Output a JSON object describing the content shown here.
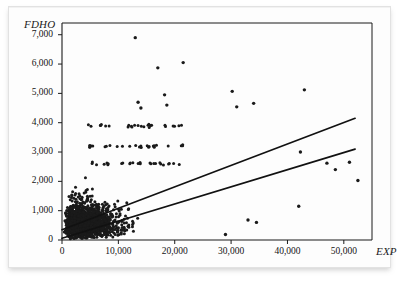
{
  "figure": {
    "kind": "scatter-plot-with-regression-lines",
    "background_color": "#ffffff",
    "border_color": "#e2e2e2",
    "ink_color": "#1a1a1a"
  },
  "chart_data": {
    "type": "scatter",
    "title": "",
    "subtitle": "",
    "xlabel": "EXP",
    "ylabel": "FDHO",
    "xlim": [
      0,
      55000
    ],
    "ylim": [
      0,
      7400
    ],
    "grid": false,
    "legend": null,
    "xticks": [
      0,
      10000,
      20000,
      30000,
      40000,
      50000
    ],
    "xticklabels": [
      "0",
      "10,000",
      "20,000",
      "30,000",
      "40,000",
      "50,000"
    ],
    "yticks": [
      0,
      1000,
      2000,
      3000,
      4000,
      5000,
      6000,
      7000
    ],
    "yticklabels": [
      "0",
      "1,000",
      "2,000",
      "3,000",
      "4,000",
      "5,000",
      "6,000",
      "7,000"
    ],
    "marker": {
      "shape": "circle",
      "size_px": 1.6,
      "color": "#1a1a1a"
    },
    "point_count_approx": 2700,
    "annotations": [],
    "series": [
      {
        "name": "FDHO vs EXP",
        "kind": "points",
        "cloud": {
          "x_mode": 7000,
          "x_max": 53000,
          "spread_model": "lognormal-fan",
          "y_median_at_x": "approximately 0.055*EXP + 380",
          "y_scatter_grows_with_x": true
        },
        "outliers": [
          {
            "x": 13000,
            "y": 6900
          },
          {
            "x": 17000,
            "y": 5870
          },
          {
            "x": 21500,
            "y": 6050
          },
          {
            "x": 18200,
            "y": 4950
          },
          {
            "x": 30200,
            "y": 5070
          },
          {
            "x": 43000,
            "y": 5120
          },
          {
            "x": 34000,
            "y": 4660
          },
          {
            "x": 31000,
            "y": 4540
          },
          {
            "x": 13500,
            "y": 4700
          },
          {
            "x": 14000,
            "y": 4500
          },
          {
            "x": 18600,
            "y": 4600
          },
          {
            "x": 42300,
            "y": 3000
          },
          {
            "x": 47000,
            "y": 2620
          },
          {
            "x": 48500,
            "y": 2400
          },
          {
            "x": 51000,
            "y": 2650
          },
          {
            "x": 52500,
            "y": 2030
          },
          {
            "x": 42000,
            "y": 1150
          },
          {
            "x": 34500,
            "y": 600
          },
          {
            "x": 33000,
            "y": 680
          },
          {
            "x": 29000,
            "y": 190
          }
        ]
      },
      {
        "name": "fitted line upper",
        "kind": "line",
        "x0": 0,
        "y0": 350,
        "x1": 52000,
        "y1": 4150
      },
      {
        "name": "fitted line lower",
        "kind": "line",
        "x0": 0,
        "y0": 60,
        "x1": 52000,
        "y1": 3100
      }
    ]
  }
}
